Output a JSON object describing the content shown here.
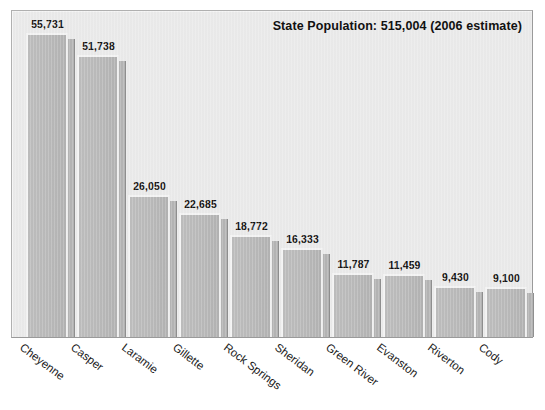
{
  "chart_data": {
    "type": "bar",
    "title": "State Population: 515,004 (2006 estimate)",
    "xlabel": "",
    "ylabel": "",
    "ylim": [
      0,
      60000
    ],
    "grid": false,
    "legend": "none",
    "value_labels": true,
    "categories": [
      "Cheyenne",
      "Casper",
      "Laramie",
      "Gillette",
      "Rock Springs",
      "Sheridan",
      "Green River",
      "Evanston",
      "Riverton",
      "Cody"
    ],
    "values": [
      55731,
      51738,
      26050,
      22685,
      18772,
      16333,
      11787,
      11459,
      9430,
      9100
    ],
    "value_label_text": [
      "55,731",
      "51,738",
      "26,050",
      "22,685",
      "18,772",
      "16,333",
      "11,787",
      "11,459",
      "9,430",
      "9,100"
    ]
  },
  "colors": {
    "plot_background": "#eaeaea",
    "page_background": "#ffffff",
    "bar_fill": "#b9b9b9",
    "bar_highlight": "#f3f3f3",
    "bar_shadow": "#b4b4b4",
    "frame_border": "#9a9a9a",
    "text": "#141414"
  }
}
